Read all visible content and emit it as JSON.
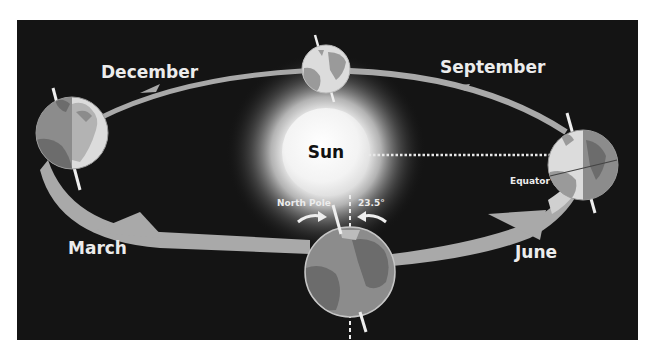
{
  "colors": {
    "background": "#141414",
    "orbit": "#a9a9a9",
    "orbit_light": "#d0d0d0",
    "label_text": "#ececec",
    "sun_core": "#f2f2f2",
    "ocean": "#8c8c8c",
    "land": "#6c6c6c",
    "ocean_lit": "#dcdcdc",
    "land_lit": "#b3b3b3",
    "axis": "#eeeeee"
  },
  "labels": {
    "sun": "Sun",
    "december": "December",
    "september": "September",
    "march": "March",
    "june": "June",
    "north_pole": "North Pole",
    "tilt_angle": "23.5°",
    "equator": "Equator"
  },
  "diagram": {
    "axial_tilt_degrees": 23.5,
    "positions": [
      {
        "month": "December",
        "location": "left"
      },
      {
        "month": "September",
        "location": "top"
      },
      {
        "month": "June",
        "location": "right"
      },
      {
        "month": "March",
        "location": "bottom"
      }
    ]
  }
}
